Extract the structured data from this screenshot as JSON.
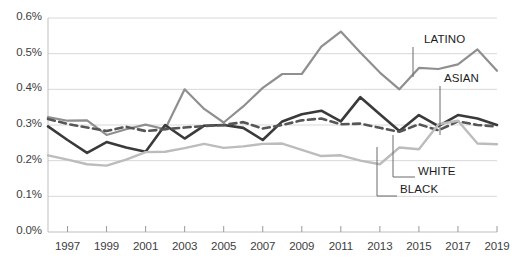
{
  "chart_data": {
    "type": "line",
    "title": "",
    "subtitle": "",
    "xlabel": "",
    "ylabel": "",
    "xlim": [
      1996,
      2019
    ],
    "ylim": [
      0.0,
      0.6
    ],
    "grid": true,
    "grid_axis": "y",
    "legend_position": "inline-annotations",
    "x": [
      1996,
      1997,
      1998,
      1999,
      2000,
      2001,
      2002,
      2003,
      2004,
      2005,
      2006,
      2007,
      2008,
      2009,
      2010,
      2011,
      2012,
      2013,
      2014,
      2015,
      2016,
      2017,
      2018,
      2019
    ],
    "y_ticks": [
      0.0,
      0.1,
      0.2,
      0.3,
      0.4,
      0.5,
      0.6
    ],
    "y_tick_labels": [
      "0.0%",
      "0.1%",
      "0.2%",
      "0.3%",
      "0.4%",
      "0.5%",
      "0.6%"
    ],
    "x_ticks": [
      1997,
      1999,
      2001,
      2003,
      2005,
      2007,
      2009,
      2011,
      2013,
      2015,
      2017,
      2019
    ],
    "x_tick_labels": [
      "1997",
      "1999",
      "2001",
      "2003",
      "2005",
      "2007",
      "2009",
      "2011",
      "2013",
      "2015",
      "2017",
      "2019"
    ],
    "series": [
      {
        "name": "LATINO",
        "color": "#8f8f8f",
        "style": "solid",
        "width": 2.2,
        "label": "LATINO",
        "values": [
          0.322,
          0.312,
          0.313,
          0.272,
          0.288,
          0.301,
          0.288,
          0.4,
          0.345,
          0.307,
          0.352,
          0.404,
          0.443,
          0.443,
          0.52,
          0.562,
          0.503,
          0.447,
          0.4,
          0.46,
          0.457,
          0.47,
          0.512,
          0.452
        ]
      },
      {
        "name": "BLACK",
        "color": "#3a3a3a",
        "style": "solid",
        "width": 2.6,
        "label": "BLACK",
        "values": [
          0.296,
          0.258,
          0.222,
          0.252,
          0.237,
          0.225,
          0.3,
          0.262,
          0.298,
          0.3,
          0.292,
          0.258,
          0.31,
          0.33,
          0.34,
          0.31,
          0.378,
          0.33,
          0.283,
          0.328,
          0.297,
          0.328,
          0.318,
          0.3
        ]
      },
      {
        "name": "WHITE",
        "color": "#565656",
        "style": "dashed",
        "width": 2.6,
        "label": "WHITE",
        "values": [
          0.317,
          0.303,
          0.293,
          0.283,
          0.295,
          0.283,
          0.288,
          0.293,
          0.297,
          0.3,
          0.308,
          0.29,
          0.3,
          0.313,
          0.318,
          0.302,
          0.304,
          0.292,
          0.281,
          0.302,
          0.285,
          0.31,
          0.3,
          0.296
        ]
      },
      {
        "name": "ASIAN",
        "color": "#bcbcbc",
        "style": "solid",
        "width": 2.4,
        "label": "ASIAN",
        "values": [
          0.215,
          0.203,
          0.19,
          0.186,
          0.203,
          0.224,
          0.225,
          0.235,
          0.247,
          0.236,
          0.24,
          0.247,
          0.248,
          0.23,
          0.213,
          0.215,
          0.2,
          0.19,
          0.237,
          0.232,
          0.302,
          0.312,
          0.248,
          0.246
        ]
      }
    ],
    "annotations": [
      {
        "name": "LATINO",
        "text": "LATINO",
        "x_px": 424,
        "y_px": 40,
        "leader_x": 413,
        "leader_y1": 47,
        "leader_y2": 77
      },
      {
        "name": "ASIAN",
        "text": "ASIAN",
        "x_px": 444,
        "y_px": 79,
        "leader_x": 440,
        "leader_y1": 86,
        "leader_y2": 135
      },
      {
        "name": "WHITE",
        "text": "WHITE",
        "x_px": 418,
        "y_px": 172,
        "leader_x": 393,
        "leader_y1": 177,
        "leader_y2": 135,
        "leader_x2": 415
      },
      {
        "name": "BLACK",
        "text": "BLACK",
        "x_px": 400,
        "y_px": 190,
        "leader_x": 377,
        "leader_y1": 196,
        "leader_y2": 147,
        "leader_x2": 397
      }
    ]
  },
  "axes": {
    "plot_left_px": 48,
    "plot_right_px": 497,
    "plot_top_px": 18,
    "plot_bottom_px": 232,
    "axis_color": "#bfbfbf",
    "grid_color": "#d8d8d8",
    "tick_color": "#9a9a9a",
    "background": "#ffffff"
  }
}
